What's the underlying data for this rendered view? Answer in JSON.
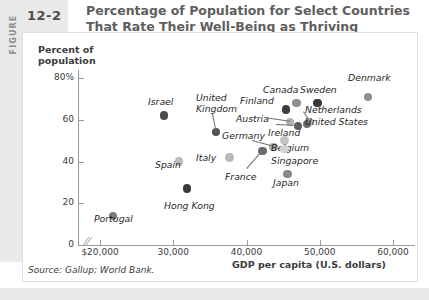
{
  "figure": {
    "tag_word": "FIGURE",
    "number": "12-2",
    "title_line1": "Percentage of Population for Select Countries",
    "title_line2": "That Rate Their Well-Being as Thriving",
    "source": "Source: Gallup; World Bank."
  },
  "chart_data": {
    "type": "scatter",
    "title": "Percentage of Population for Select Countries That Rate Their Well-Being as Thriving",
    "xlabel": "GDP per capita (U.S. dollars)",
    "ylabel": "Percent of population",
    "xlim": [
      20000,
      60000
    ],
    "ylim": [
      0,
      80
    ],
    "xticks": [
      "$20,000",
      "30,000",
      "40,000",
      "50,000",
      "60,000"
    ],
    "xtick_values": [
      20000,
      30000,
      40000,
      50000,
      60000
    ],
    "yticks": [
      "0",
      "20",
      "40",
      "60",
      "80%"
    ],
    "ytick_values": [
      0,
      20,
      40,
      60,
      80
    ],
    "axis_break": true,
    "grid": false,
    "legend": "none",
    "points": [
      {
        "label": "Portugal",
        "x": 21800,
        "y": 14,
        "shade": "#7c7c7c",
        "lx": 94,
        "ly": 213,
        "anchor": "start"
      },
      {
        "label": "Israel",
        "x": 28700,
        "y": 62,
        "shade": "#4a4a4a",
        "lx": 148,
        "ly": 96,
        "anchor": "start"
      },
      {
        "label": "Spain",
        "x": 30800,
        "y": 40,
        "shade": "#bdbdbd",
        "lx": 155,
        "ly": 159,
        "anchor": "start"
      },
      {
        "label": "Hong Kong",
        "x": 31900,
        "y": 27,
        "shade": "#3a3a3a",
        "lx": 164,
        "ly": 200,
        "anchor": "start"
      },
      {
        "label": "United Kingdom",
        "x": 35800,
        "y": 54,
        "shade": "#4f4f4f",
        "lx": 196,
        "ly": 92,
        "anchor": "start"
      },
      {
        "label": "Italy",
        "x": 37700,
        "y": 42,
        "shade": "#b8b8b8",
        "lx": 196,
        "ly": 152,
        "anchor": "start"
      },
      {
        "label": "France",
        "x": 42200,
        "y": 45,
        "shade": "#6b6b6b",
        "lx": 225,
        "ly": 171,
        "anchor": "start"
      },
      {
        "label": "Germany",
        "x": 43700,
        "y": 47,
        "shade": "#b0b0b0",
        "lx": 222,
        "ly": 130,
        "anchor": "start"
      },
      {
        "label": "Finland",
        "x": 45400,
        "y": 65,
        "shade": "#3d3d3d",
        "lx": 240,
        "ly": 95,
        "anchor": "start"
      },
      {
        "label": "Austria",
        "x": 45900,
        "y": 59,
        "shade": "#b4b4b4",
        "lx": 236,
        "ly": 113,
        "anchor": "start"
      },
      {
        "label": "Ireland",
        "x": 47000,
        "y": 57,
        "shade": "#5c5c5c",
        "lx": 268,
        "ly": 127,
        "anchor": "start"
      },
      {
        "label": "Belgium",
        "x": 45200,
        "y": 50,
        "shade": "#c2c2c2",
        "lx": 271,
        "ly": 142,
        "anchor": "start"
      },
      {
        "label": "Singapore",
        "x": 45200,
        "y": 46,
        "shade": "#d2d2d2",
        "lx": 271,
        "ly": 155,
        "anchor": "start"
      },
      {
        "label": "Japan",
        "x": 45600,
        "y": 34,
        "shade": "#8a8a8a",
        "lx": 273,
        "ly": 177,
        "anchor": "start"
      },
      {
        "label": "Netherlands",
        "x": 48600,
        "y": 59,
        "shade": "#c2c2c2",
        "lx": 305,
        "ly": 104,
        "anchor": "start"
      },
      {
        "label": "United States",
        "x": 48300,
        "y": 58,
        "shade": "#6e6e6e",
        "lx": 305,
        "ly": 116,
        "anchor": "start"
      },
      {
        "label": "Canada",
        "x": 46800,
        "y": 68,
        "shade": "#909090",
        "lx": 263,
        "ly": 84,
        "anchor": "start"
      },
      {
        "label": "Sweden",
        "x": 49700,
        "y": 68,
        "shade": "#3a3a3a",
        "lx": 300,
        "ly": 84,
        "anchor": "start"
      },
      {
        "label": "Denmark",
        "x": 56600,
        "y": 71,
        "shade": "#8e8e8e",
        "lx": 348,
        "ly": 72,
        "anchor": "start"
      }
    ]
  }
}
